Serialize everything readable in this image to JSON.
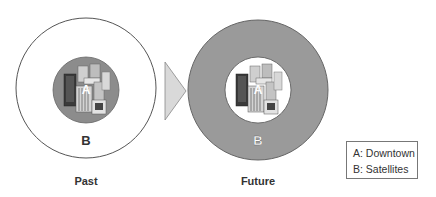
{
  "diagram": {
    "past": {
      "caption": "Past",
      "inner_label": "A",
      "outer_label": "B"
    },
    "future": {
      "caption": "Future",
      "inner_label": "A",
      "outer_label": "B"
    },
    "legend": {
      "items": [
        {
          "key": "A",
          "text": "A: Downtown"
        },
        {
          "key": "B",
          "text": "B: Satellites"
        }
      ]
    },
    "colors": {
      "ring_fill_future": "#9a9a9a",
      "core_fill_past": "#8c8c8c",
      "outline": "#555555",
      "arrow_fill": "#d9d9d9"
    }
  }
}
